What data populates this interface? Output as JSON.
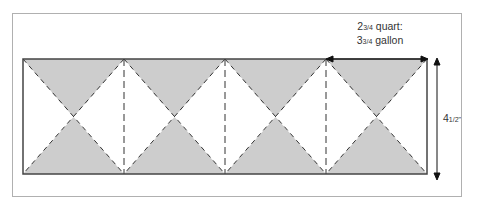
{
  "diagram": {
    "type": "quilt-strip-cutting-diagram",
    "colors": {
      "frame": "#aaaaaa",
      "strip_border": "#444444",
      "shaded": "#cdcdcd",
      "dashes": "#333333",
      "arrow": "#111111"
    },
    "labels": {
      "width_line1_whole": "2",
      "width_line1_frac": "3/4",
      "width_line1_text": " quart:",
      "width_line2_whole": "3",
      "width_line2_frac": "3/4",
      "width_line2_text": " gallon",
      "height_whole": "4",
      "height_frac": "1/2",
      "height_unit": "\""
    },
    "units": [
      {
        "index": 1
      },
      {
        "index": 2
      },
      {
        "index": 3
      },
      {
        "index": 4
      }
    ]
  }
}
